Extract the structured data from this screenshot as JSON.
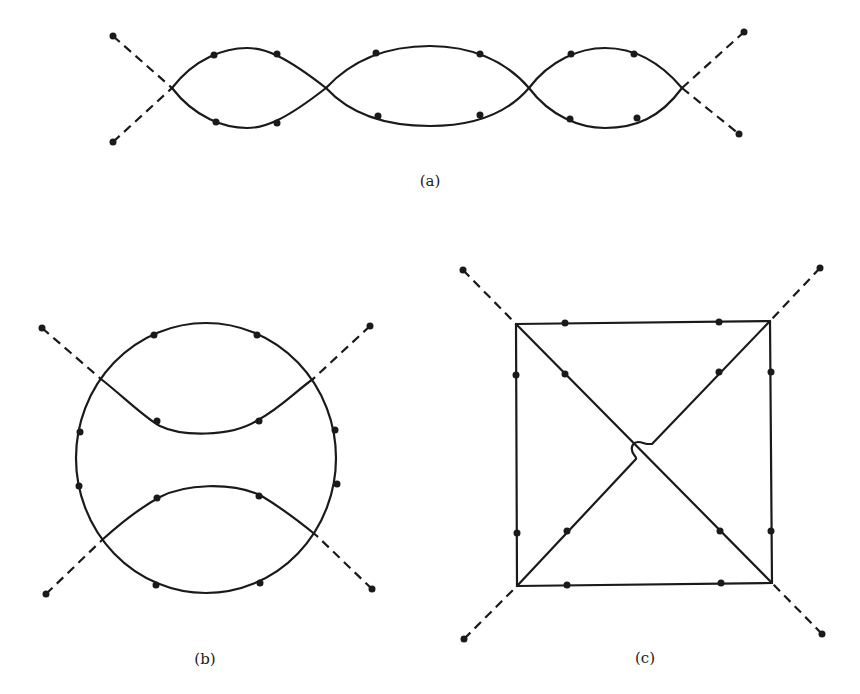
{
  "figure": {
    "panels": [
      {
        "id": "a",
        "caption": "(a)",
        "description": "Chain of three loops (two-fold crossings) with four external dashed legs"
      },
      {
        "id": "b",
        "caption": "(b)",
        "description": "Circle with two inner arcs, four external dashed legs"
      },
      {
        "id": "c",
        "caption": "(c)",
        "description": "Square with crossing diagonals (one hopping over the other), four external dashed legs"
      }
    ],
    "colors": {
      "line": "#1a1a1a",
      "background": "#ffffff"
    }
  }
}
